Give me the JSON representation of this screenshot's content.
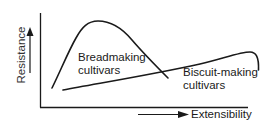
{
  "diagram": {
    "y_axis_label": "Resistance",
    "x_axis_label": "Extensibility",
    "curves": [
      {
        "name": "breadmaking",
        "label_line1": "Breadmaking",
        "label_line2": "cultivars",
        "description": "tall peaked curve: high resistance, low extensibility"
      },
      {
        "name": "biscuit-making",
        "label_line1": "Biscuit-making",
        "label_line2": "cultivars",
        "description": "low, long curve: low resistance, high extensibility"
      }
    ],
    "colors": {
      "line": "#1a1a1a",
      "background": "#ffffff"
    }
  }
}
